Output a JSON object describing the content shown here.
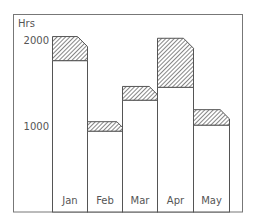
{
  "chart_data": {
    "type": "bar",
    "stacked": true,
    "title": "",
    "xlabel": "",
    "ylabel": "Hrs",
    "categories": [
      "Jan",
      "Feb",
      "Mar",
      "Apr",
      "May"
    ],
    "series": [
      {
        "name": "base (plain)",
        "values": [
          1760,
          940,
          1300,
          1450,
          1010
        ]
      },
      {
        "name": "additional (hatched)",
        "values": [
          280,
          110,
          160,
          570,
          180
        ]
      }
    ],
    "totals": [
      2040,
      1050,
      1460,
      2020,
      1190
    ],
    "y_ticks": [
      1000,
      2000
    ],
    "y_tick_labels": [
      "1000",
      "2000"
    ],
    "ylim": [
      0,
      2300
    ],
    "grid": false,
    "legend": "none"
  },
  "colors": {
    "frame": "#777777",
    "bar_outline": "#555555",
    "bar_fill": "#ffffff",
    "hatch": "#444444",
    "text": "#555555"
  }
}
